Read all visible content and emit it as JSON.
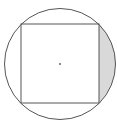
{
  "figure": {
    "shapes": {
      "circle": {
        "label": "circumscribed-circle"
      },
      "square": {
        "label": "inscribed-square"
      },
      "center": {
        "label": "center-point"
      },
      "shaded_region": {
        "label": "shaded-segment",
        "side": "right"
      }
    },
    "colors": {
      "stroke": "#555555",
      "fill_shaded": "#d9d9d9",
      "background": "#ffffff"
    }
  }
}
